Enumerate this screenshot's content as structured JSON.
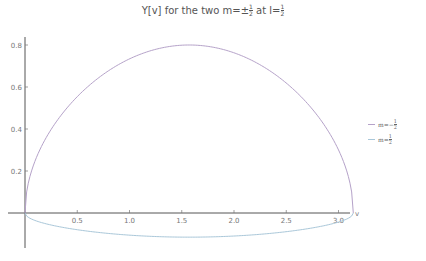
{
  "chart_data": {
    "type": "line",
    "xlabel": "v",
    "ylabel": "",
    "xlim": [
      0,
      3.1416
    ],
    "ylim": [
      -0.15,
      0.85
    ],
    "x_ticks": [
      "0.5",
      "1.0",
      "1.5",
      "2.0",
      "2.5",
      "3.0"
    ],
    "x_tick_values": [
      0.5,
      1.0,
      1.5,
      2.0,
      2.5,
      3.0
    ],
    "y_ticks": [
      "0.2",
      "0.4",
      "0.6",
      "0.8"
    ],
    "y_tick_values": [
      0.2,
      0.4,
      0.6,
      0.8
    ],
    "grid": false,
    "legend_position": "right",
    "series": [
      {
        "name": "m=-½",
        "color": "#b5a2c9",
        "x": [
          0,
          0.1,
          0.3,
          0.5,
          0.785,
          1.0,
          1.2,
          1.5708,
          1.9,
          2.1,
          2.356,
          2.6,
          2.8,
          3.0,
          3.1,
          3.1416
        ],
        "values": [
          0,
          0.252,
          0.436,
          0.554,
          0.673,
          0.734,
          0.772,
          0.8,
          0.779,
          0.741,
          0.673,
          0.577,
          0.468,
          0.3,
          0.162,
          0
        ]
      },
      {
        "name": "m=½",
        "color": "#a9c7d9",
        "x": [
          0,
          0.1,
          0.3,
          0.5,
          0.785,
          1.0,
          1.2,
          1.5708,
          1.9,
          2.1,
          2.356,
          2.6,
          2.8,
          3.0,
          3.1,
          3.1416
        ],
        "values": [
          0,
          -0.036,
          -0.063,
          -0.08,
          -0.097,
          -0.105,
          -0.111,
          -0.115,
          -0.112,
          -0.107,
          -0.097,
          -0.083,
          -0.067,
          -0.043,
          -0.023,
          0
        ]
      }
    ]
  },
  "title": {
    "main": "Y[v] for the two m=±",
    "frac1_num": "1",
    "frac1_den": "2",
    "mid": " at l=",
    "frac2_num": "1",
    "frac2_den": "2"
  },
  "legend": {
    "items": [
      {
        "prefix": "m=−",
        "num": "1",
        "den": "2",
        "color": "#b5a2c9"
      },
      {
        "prefix": "m=",
        "num": "1",
        "den": "2",
        "color": "#a9c7d9"
      }
    ]
  },
  "axes": {
    "x_label": "v"
  }
}
